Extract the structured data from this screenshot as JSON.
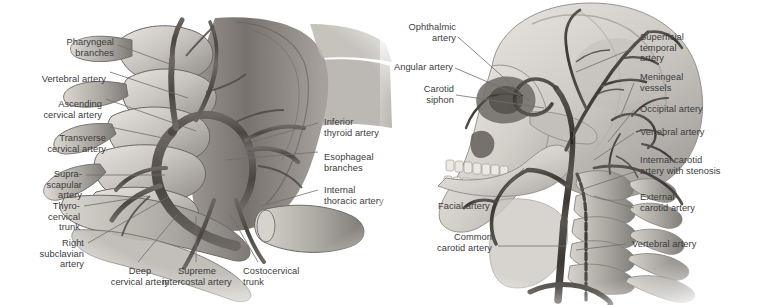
{
  "figure": {
    "background": "#ffffff",
    "text_color": "#3b3b3d",
    "leader_color": "#6e6e72",
    "panels": [
      {
        "id": "left",
        "name": "cervical-vessels-dissection",
        "description": "Grayscale anatomical dissection of the right side of the neck showing cervical vertebrae, subclavian and thyrocervical vessels"
      },
      {
        "id": "right",
        "name": "skull-carotid-angiogram",
        "description": "Grayscale lateral skull and cervical spine with carotid and vertebral arterial tree"
      }
    ]
  },
  "left_panel": {
    "labels_left": [
      {
        "name": "pharyngeal-branches",
        "text": "Pharyngeal\nbranches"
      },
      {
        "name": "vertebral-artery-left",
        "text": "Vertebral artery"
      },
      {
        "name": "ascending-cervical-artery",
        "text": "Ascending\ncervical artery"
      },
      {
        "name": "transverse-cervical-artery",
        "text": "Transverse\ncervical artery"
      },
      {
        "name": "suprascapular-artery",
        "text": "Supra-\nscapular\nartery"
      },
      {
        "name": "thyrocervical-trunk",
        "text": "Thyro-\ncervical\ntrunk"
      },
      {
        "name": "right-subclavian-artery",
        "text": "Right\nsubclavian\nartery"
      }
    ],
    "labels_right": [
      {
        "name": "inferior-thyroid-artery",
        "text": "Inferior\nthyroid artery"
      },
      {
        "name": "esophageal-branches",
        "text": "Esophageal\nbranches"
      },
      {
        "name": "internal-thoracic-artery",
        "text": "Internal\nthoracic artery"
      }
    ],
    "labels_bottom": [
      {
        "name": "deep-cervical-artery",
        "text": "Deep\ncervical artery"
      },
      {
        "name": "supreme-intercostal-artery",
        "text": "Supreme\nintercostal artery"
      },
      {
        "name": "costocervical-trunk",
        "text": "Costocervical\ntrunk"
      }
    ]
  },
  "right_panel": {
    "labels_left": [
      {
        "name": "ophthalmic-artery",
        "text": "Ophthalmic\nartery"
      },
      {
        "name": "angular-artery",
        "text": "Angular artery"
      },
      {
        "name": "carotid-siphon",
        "text": "Carotid\nsiphon"
      },
      {
        "name": "facial-artery",
        "text": "Facial artery"
      },
      {
        "name": "common-carotid-artery",
        "text": "Common\ncarotid artery"
      }
    ],
    "labels_right": [
      {
        "name": "superficial-temporal-artery",
        "text": "Superficial\ntemporal\nartery"
      },
      {
        "name": "meningeal-vessels",
        "text": "Meningeal\nvessels"
      },
      {
        "name": "occipital-artery",
        "text": "Occipital artery"
      },
      {
        "name": "vertebral-artery-upper",
        "text": "Vertebral artery"
      },
      {
        "name": "internal-carotid-artery-stenosis",
        "text": "Internal carotid\nartery with stenosis"
      },
      {
        "name": "external-carotid-artery",
        "text": "External\ncarotid artery"
      },
      {
        "name": "vertebral-artery-lower",
        "text": "Vertebral artery"
      }
    ]
  }
}
